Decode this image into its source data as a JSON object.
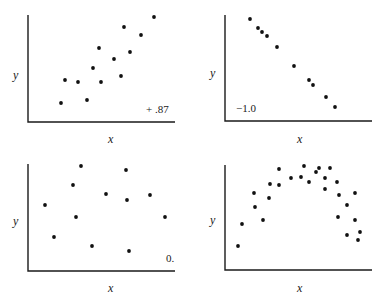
{
  "chart_data": [
    {
      "type": "scatter",
      "title": "",
      "xlabel": "x",
      "ylabel": "y",
      "annotation": "+.87",
      "grid": false,
      "panel_position": "top-left",
      "points_px": [
        [
          61,
          103
        ],
        [
          65,
          80
        ],
        [
          78,
          82
        ],
        [
          87,
          100
        ],
        [
          93,
          68
        ],
        [
          99,
          48
        ],
        [
          101,
          82
        ],
        [
          114,
          59
        ],
        [
          121,
          76
        ],
        [
          124,
          27
        ],
        [
          130,
          52
        ],
        [
          141,
          35
        ],
        [
          154,
          17
        ]
      ],
      "description": "Strong positive correlation, r = +.87"
    },
    {
      "type": "scatter",
      "title": "",
      "xlabel": "x",
      "ylabel": "y",
      "annotation": "−1.0",
      "grid": false,
      "panel_position": "top-right",
      "points_px": [
        [
          250,
          19
        ],
        [
          258,
          28
        ],
        [
          262,
          32
        ],
        [
          267,
          36
        ],
        [
          277,
          47
        ],
        [
          294,
          66
        ],
        [
          309,
          80
        ],
        [
          313,
          85
        ],
        [
          326,
          97
        ],
        [
          335,
          107
        ]
      ],
      "description": "Perfect negative correlation, r = -1.0"
    },
    {
      "type": "scatter",
      "title": "",
      "xlabel": "x",
      "ylabel": "y",
      "annotation": "0.",
      "grid": false,
      "panel_position": "bottom-left",
      "points_px": [
        [
          45,
          205
        ],
        [
          54,
          237
        ],
        [
          73,
          185
        ],
        [
          76,
          217
        ],
        [
          81,
          166
        ],
        [
          92,
          246
        ],
        [
          106,
          194
        ],
        [
          126,
          170
        ],
        [
          127,
          200
        ],
        [
          129,
          251
        ],
        [
          150,
          195
        ],
        [
          165,
          217
        ]
      ],
      "description": "No correlation, r = 0"
    },
    {
      "type": "scatter",
      "title": "",
      "xlabel": "x",
      "ylabel": "y",
      "annotation": "",
      "grid": false,
      "panel_position": "bottom-right",
      "points_px": [
        [
          238,
          246
        ],
        [
          242,
          224
        ],
        [
          254,
          193
        ],
        [
          255,
          207
        ],
        [
          263,
          220
        ],
        [
          269,
          198
        ],
        [
          270,
          184
        ],
        [
          279,
          169
        ],
        [
          279,
          185
        ],
        [
          291,
          178
        ],
        [
          301,
          177
        ],
        [
          304,
          166
        ],
        [
          309,
          182
        ],
        [
          316,
          172
        ],
        [
          319,
          168
        ],
        [
          325,
          189
        ],
        [
          325,
          178
        ],
        [
          330,
          168
        ],
        [
          337,
          182
        ],
        [
          338,
          217
        ],
        [
          339,
          195
        ],
        [
          347,
          205
        ],
        [
          347,
          235
        ],
        [
          355,
          193
        ],
        [
          355,
          220
        ],
        [
          358,
          240
        ],
        [
          360,
          232
        ]
      ],
      "description": "Curvilinear (inverted U) relationship, no linear label"
    }
  ],
  "panels": [
    {
      "xlabel": "x",
      "ylabel": "y",
      "annotation": "+ .87"
    },
    {
      "xlabel": "x",
      "ylabel": "y",
      "annotation": "−1.0"
    },
    {
      "xlabel": "x",
      "ylabel": "y",
      "annotation": "0."
    },
    {
      "xlabel": "x",
      "ylabel": "y",
      "annotation": ""
    }
  ]
}
